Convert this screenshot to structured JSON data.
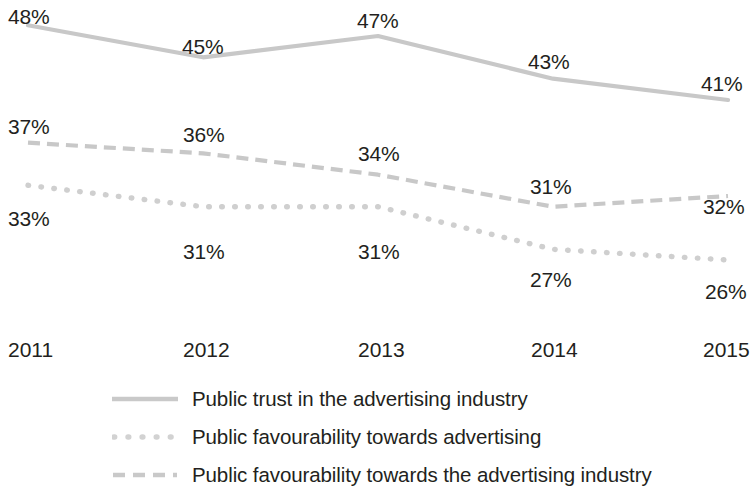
{
  "chart_data": {
    "type": "line",
    "title": "",
    "xlabel": "",
    "ylabel": "",
    "categories": [
      "2011",
      "2012",
      "2013",
      "2014",
      "2015"
    ],
    "grid": false,
    "legend_position": "bottom",
    "ylim": [
      20,
      50
    ],
    "value_suffix": "%",
    "series": [
      {
        "name": "Public trust in the advertising industry",
        "style": "solid",
        "color": "#c8c8c8",
        "values": [
          48,
          45,
          47,
          43,
          41
        ],
        "labels": [
          "48%",
          "45%",
          "47%",
          "43%",
          "41%"
        ]
      },
      {
        "name": "Public favourability towards the advertising industry",
        "style": "dashed",
        "color": "#c8c8c8",
        "values": [
          37,
          36,
          34,
          31,
          32
        ],
        "labels": [
          "37%",
          "36%",
          "34%",
          "31%",
          "32%"
        ]
      },
      {
        "name": "Public favourability towards advertising",
        "style": "dotted",
        "color": "#cfcfcf",
        "values": [
          33,
          31,
          31,
          27,
          26
        ],
        "labels": [
          "33%",
          "31%",
          "31%",
          "27%",
          "26%"
        ]
      }
    ]
  },
  "axis": {
    "ticks": [
      {
        "label": "2011"
      },
      {
        "label": "2012"
      },
      {
        "label": "2013"
      },
      {
        "label": "2014"
      },
      {
        "label": "2015"
      }
    ]
  },
  "data_labels": {
    "trust": {
      "y2011": "48%",
      "y2012": "45%",
      "y2013": "47%",
      "y2014": "43%",
      "y2015": "41%"
    },
    "fav_industry": {
      "y2011": "37%",
      "y2012": "36%",
      "y2013": "34%",
      "y2014": "31%",
      "y2015": "32%"
    },
    "fav_advertising": {
      "y2011": "33%",
      "y2012": "31%",
      "y2013": "31%",
      "y2014": "27%",
      "y2015": "26%"
    }
  },
  "legend": {
    "items": [
      {
        "label": "Public trust in the advertising industry",
        "style": "solid"
      },
      {
        "label": "Public favourability towards advertising",
        "style": "dotted"
      },
      {
        "label": "Public favourability towards the advertising industry",
        "style": "dashed"
      }
    ]
  }
}
